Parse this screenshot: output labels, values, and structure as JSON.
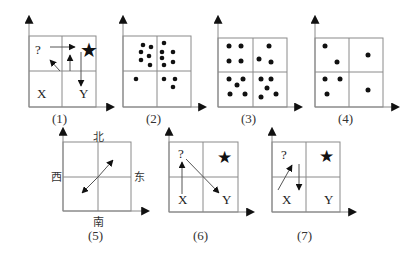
{
  "figures": [
    {
      "id": "1",
      "caption": "(1)",
      "labels": {
        "q": "?",
        "x": "X",
        "y": "Y"
      }
    },
    {
      "id": "2",
      "caption": "(2)"
    },
    {
      "id": "3",
      "caption": "(3)"
    },
    {
      "id": "4",
      "caption": "(4)"
    },
    {
      "id": "5",
      "caption": "(5)",
      "labels": {
        "north": "北",
        "south": "南",
        "west": "西",
        "east": "东"
      }
    },
    {
      "id": "6",
      "caption": "(6)",
      "labels": {
        "q": "?",
        "x": "X",
        "y": "Y"
      }
    },
    {
      "id": "7",
      "caption": "(7)",
      "labels": {
        "q": "?",
        "x": "X",
        "y": "Y"
      }
    }
  ],
  "icons": {
    "star": "star-icon",
    "dot": "dot-icon",
    "arrow": "arrow-icon"
  },
  "colors": {
    "grid": "#8a8a8a",
    "ink": "#111111",
    "background": "#ffffff"
  }
}
